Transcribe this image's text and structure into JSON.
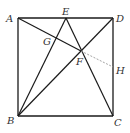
{
  "diagram": {
    "title": "",
    "colors": {
      "line": "#1a1a1a",
      "dashed": "#9a9a9a",
      "label": "#333333"
    },
    "points": {
      "A": {
        "label": "A",
        "x": 18,
        "y": 18
      },
      "B": {
        "label": "B",
        "x": 18,
        "y": 116
      },
      "C": {
        "label": "C",
        "x": 113,
        "y": 116
      },
      "D": {
        "label": "D",
        "x": 113,
        "y": 18
      },
      "E": {
        "label": "E",
        "x": 66,
        "y": 18
      },
      "F": {
        "label": "F",
        "x": 81,
        "y": 51
      },
      "G": {
        "label": "G",
        "x": 55,
        "y": 39
      },
      "H": {
        "label": "H",
        "x": 113,
        "y": 67
      }
    },
    "segments": [
      {
        "from": "A",
        "to": "B",
        "style": "solid"
      },
      {
        "from": "B",
        "to": "C",
        "style": "solid"
      },
      {
        "from": "C",
        "to": "D",
        "style": "solid"
      },
      {
        "from": "D",
        "to": "A",
        "style": "solid"
      },
      {
        "from": "B",
        "to": "E",
        "style": "solid"
      },
      {
        "from": "E",
        "to": "C",
        "style": "solid"
      },
      {
        "from": "B",
        "to": "D",
        "style": "solid"
      },
      {
        "from": "A",
        "to": "F",
        "style": "solid"
      },
      {
        "from": "F",
        "to": "H",
        "style": "dashed"
      }
    ]
  }
}
